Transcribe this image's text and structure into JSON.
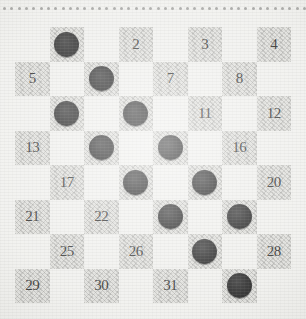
{
  "diagram": {
    "type": "draughts-board-position",
    "board": {
      "rows": 8,
      "columns": 8,
      "numbered_squares": 32,
      "numbering_scheme": "standard-checkers-1-to-32-dark-squares"
    },
    "colors": {
      "paper": "#efefec",
      "dark_square": "#dededa",
      "light_square": "#efefec",
      "piece": "#000000",
      "number_text": "#161614",
      "perforation_dot": "#9a9a98"
    },
    "perforation": {
      "dot_count": 42,
      "position": "top-edge"
    },
    "legend": {
      "piece_label": "black-piece",
      "empty_label": "empty-square"
    },
    "squares": [
      {
        "number": "1",
        "row": 0,
        "col": 1,
        "piece": true
      },
      {
        "number": "2",
        "row": 0,
        "col": 3,
        "piece": false
      },
      {
        "number": "3",
        "row": 0,
        "col": 5,
        "piece": false
      },
      {
        "number": "4",
        "row": 0,
        "col": 7,
        "piece": false
      },
      {
        "number": "5",
        "row": 1,
        "col": 0,
        "piece": false
      },
      {
        "number": "6",
        "row": 1,
        "col": 2,
        "piece": true
      },
      {
        "number": "7",
        "row": 1,
        "col": 4,
        "piece": false
      },
      {
        "number": "8",
        "row": 1,
        "col": 6,
        "piece": false
      },
      {
        "number": "9",
        "row": 2,
        "col": 1,
        "piece": true
      },
      {
        "number": "10",
        "row": 2,
        "col": 3,
        "piece": true
      },
      {
        "number": "11",
        "row": 2,
        "col": 5,
        "piece": false
      },
      {
        "number": "12",
        "row": 2,
        "col": 7,
        "piece": false
      },
      {
        "number": "13",
        "row": 3,
        "col": 0,
        "piece": false
      },
      {
        "number": "14",
        "row": 3,
        "col": 2,
        "piece": true
      },
      {
        "number": "15",
        "row": 3,
        "col": 4,
        "piece": true
      },
      {
        "number": "16",
        "row": 3,
        "col": 6,
        "piece": false
      },
      {
        "number": "17",
        "row": 4,
        "col": 1,
        "piece": false
      },
      {
        "number": "18",
        "row": 4,
        "col": 3,
        "piece": true
      },
      {
        "number": "19",
        "row": 4,
        "col": 5,
        "piece": true
      },
      {
        "number": "20",
        "row": 4,
        "col": 7,
        "piece": false
      },
      {
        "number": "21",
        "row": 5,
        "col": 0,
        "piece": false
      },
      {
        "number": "22",
        "row": 5,
        "col": 2,
        "piece": false
      },
      {
        "number": "23",
        "row": 5,
        "col": 4,
        "piece": true
      },
      {
        "number": "24",
        "row": 5,
        "col": 6,
        "piece": true
      },
      {
        "number": "25",
        "row": 6,
        "col": 1,
        "piece": false
      },
      {
        "number": "26",
        "row": 6,
        "col": 3,
        "piece": false
      },
      {
        "number": "27",
        "row": 6,
        "col": 5,
        "piece": true
      },
      {
        "number": "28",
        "row": 6,
        "col": 7,
        "piece": false
      },
      {
        "number": "29",
        "row": 7,
        "col": 0,
        "piece": false
      },
      {
        "number": "30",
        "row": 7,
        "col": 2,
        "piece": false
      },
      {
        "number": "31",
        "row": 7,
        "col": 4,
        "piece": false
      },
      {
        "number": "32",
        "row": 7,
        "col": 6,
        "piece": true
      }
    ]
  }
}
